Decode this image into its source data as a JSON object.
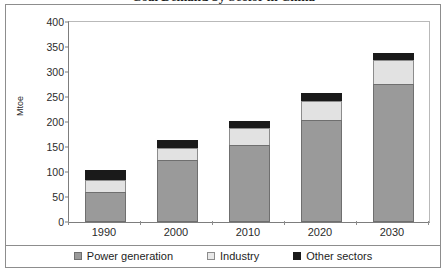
{
  "figure": {
    "title": "Coal Demand by Sector in China",
    "border_color": "#8d8d8d"
  },
  "chart_data": {
    "type": "bar",
    "stacked": true,
    "title": "",
    "xlabel": "",
    "ylabel": "Mtoe",
    "categories": [
      "1990",
      "2000",
      "2010",
      "2020",
      "2030"
    ],
    "series": [
      {
        "name": "Power generation",
        "color": "#9a9a9a",
        "values": [
          60,
          124,
          154,
          205,
          277
        ]
      },
      {
        "name": "Industry",
        "color": "#e2e2e2",
        "values": [
          24,
          24,
          34,
          38,
          48
        ]
      },
      {
        "name": "Other sectors",
        "color": "#1a1a1a",
        "values": [
          21,
          17,
          14,
          16,
          14
        ]
      }
    ],
    "totals": [
      105,
      165,
      202,
      259,
      339
    ],
    "ylim": [
      0,
      400
    ],
    "yticks": [
      0,
      50,
      100,
      150,
      200,
      250,
      300,
      350,
      400
    ],
    "ytick_labels": [
      "0",
      "50",
      "100",
      "150",
      "200",
      "250",
      "300",
      "350",
      "400"
    ],
    "grid": false,
    "legend_position": "bottom"
  },
  "legend": {
    "items": [
      {
        "label": "Power generation",
        "swatch": "power-swatch"
      },
      {
        "label": "Industry",
        "swatch": "industry-swatch"
      },
      {
        "label": "Other sectors",
        "swatch": "other-swatch"
      }
    ]
  }
}
